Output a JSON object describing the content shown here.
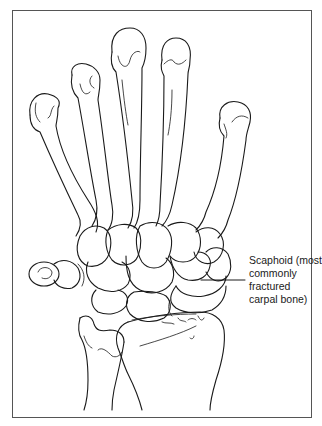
{
  "figure": {
    "colors": {
      "line": "#1a1a1a",
      "frame": "#555555",
      "background": "#ffffff"
    }
  },
  "annotation": {
    "lines": [
      "Scaphoid (most",
      "commonly",
      "fractured",
      "carpal bone)"
    ],
    "target": "scaphoid"
  }
}
